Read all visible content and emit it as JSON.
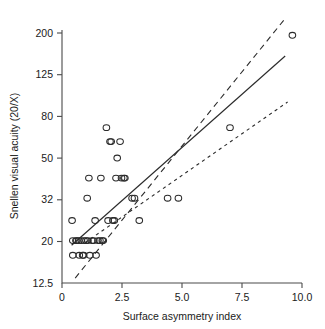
{
  "chart_data": {
    "type": "scatter",
    "title": "",
    "xlabel": "Surface asymmetry index",
    "ylabel": "Snellen visual acuity (20/X)",
    "xlim": [
      0,
      10.0
    ],
    "ylim": [
      12.5,
      200
    ],
    "yscale": "log",
    "xscale": "linear",
    "grid": false,
    "legend": null,
    "xticks": [
      0,
      2.5,
      5.0,
      7.5,
      10.0
    ],
    "xtick_labels": [
      "0",
      "2.5",
      "5.0",
      "7.5",
      "10.0"
    ],
    "yticks": [
      200,
      125,
      80,
      50,
      32,
      20,
      12.5
    ],
    "ytick_labels": [
      "200",
      "125",
      "80",
      "50",
      "32",
      "20",
      "12.5"
    ],
    "marker": "open-circle",
    "points": [
      [
        0.42,
        25
      ],
      [
        0.45,
        20
      ],
      [
        0.45,
        17
      ],
      [
        0.58,
        20
      ],
      [
        0.62,
        20
      ],
      [
        0.7,
        20
      ],
      [
        0.72,
        17
      ],
      [
        0.8,
        20
      ],
      [
        0.86,
        17
      ],
      [
        0.9,
        17
      ],
      [
        0.92,
        20
      ],
      [
        1.0,
        20
      ],
      [
        1.05,
        32
      ],
      [
        1.08,
        20
      ],
      [
        1.12,
        40
      ],
      [
        1.16,
        17
      ],
      [
        1.25,
        20
      ],
      [
        1.32,
        20
      ],
      [
        1.38,
        25
      ],
      [
        1.42,
        17
      ],
      [
        1.5,
        20
      ],
      [
        1.58,
        20
      ],
      [
        1.62,
        40
      ],
      [
        1.68,
        20
      ],
      [
        1.72,
        20
      ],
      [
        1.85,
        70
      ],
      [
        1.92,
        25
      ],
      [
        2.0,
        60
      ],
      [
        2.05,
        60
      ],
      [
        2.12,
        25
      ],
      [
        2.18,
        25
      ],
      [
        2.25,
        40
      ],
      [
        2.3,
        50
      ],
      [
        2.42,
        60
      ],
      [
        2.48,
        40
      ],
      [
        2.58,
        40
      ],
      [
        2.62,
        40
      ],
      [
        2.92,
        32
      ],
      [
        3.02,
        32
      ],
      [
        3.22,
        25
      ],
      [
        4.4,
        32
      ],
      [
        4.85,
        32
      ],
      [
        7.0,
        70
      ],
      [
        9.6,
        195
      ]
    ],
    "fit_line": {
      "style": "solid",
      "label": "regression line",
      "x": [
        0.4,
        9.3
      ],
      "y": [
        19.0,
        155.0
      ]
    },
    "confidence_bands": [
      {
        "style": "dashed",
        "label": "upper band",
        "x": [
          0.55,
          9.3
        ],
        "y": [
          13.2,
          235.0
        ]
      },
      {
        "style": "dotted",
        "label": "lower band",
        "x": [
          0.95,
          9.4
        ],
        "y": [
          19.5,
          93.0
        ]
      }
    ]
  },
  "axes": {
    "x_title": "Surface asymmetry index",
    "y_title": "Snellen visual acuity (20/X)"
  }
}
